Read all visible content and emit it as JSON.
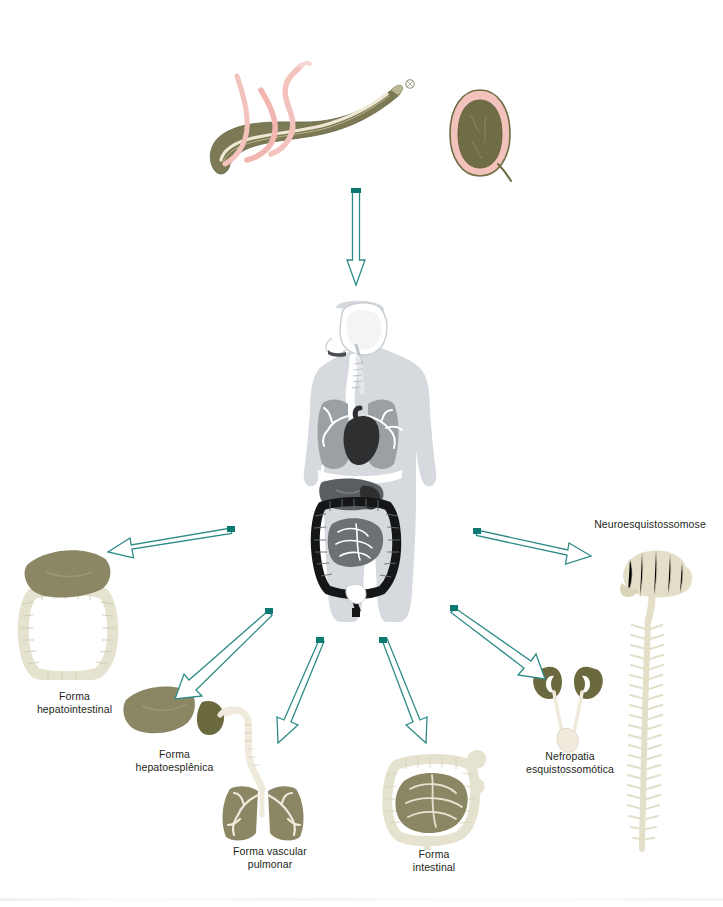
{
  "diagram": {
    "language": "pt-BR",
    "background_color": "#ffffff",
    "arrow_color": "#2e8b87",
    "arrow_cap_color": "#0c7a70",
    "arrow_fill": "#ffffff",
    "text_color": "#231f20"
  },
  "source": {
    "label": "Schistosoma mansoni",
    "worm": {
      "name": "adult-worm-pair",
      "body_color": "#7c7a54",
      "female_color": "#f4c2bd",
      "highlight_color": "#efe8d4"
    },
    "egg": {
      "name": "schistosome-egg",
      "shell_color": "#f4c2bd",
      "core_color": "#6f6d45"
    }
  },
  "host": {
    "name": "human-body-anatomy",
    "body_color": "#d6dade",
    "organ_dark": "#2e2f31",
    "organ_mid": "#7d8185",
    "organ_light": "#f2f4f5",
    "lung_color": "#9aa0a4",
    "liver_color": "#5b5e61"
  },
  "forms": [
    {
      "id": "hepatointestinal",
      "label": "Forma\nhepatointestinal",
      "organ": "liver-and-colon",
      "position": "left",
      "colors": {
        "liver": "#8b8663",
        "colon": "#e5e2cf"
      }
    },
    {
      "id": "hepatoesplenica",
      "label": "Forma\nhepatoesplênica",
      "organ": "liver-and-spleen",
      "position": "lower-left",
      "colors": {
        "liver": "#8b8663",
        "spleen": "#6b6a3f"
      }
    },
    {
      "id": "vascular-pulmonar",
      "label": "Forma vascular\npulmonar",
      "organ": "lungs-and-trachea",
      "position": "bottom-left",
      "colors": {
        "lung": "#8b8663",
        "airway": "#efeadc"
      }
    },
    {
      "id": "intestinal",
      "label": "Forma\nintestinal",
      "organ": "intestines",
      "position": "bottom-right",
      "colors": {
        "small_bowel": "#8b8663",
        "large_bowel": "#e5e2cf"
      }
    },
    {
      "id": "nefropatia",
      "label": "Nefropatia\nesquistossomótica",
      "organ": "kidneys-and-bladder",
      "position": "lower-right",
      "colors": {
        "kidney": "#6b6a3f",
        "ureter": "#efeadc"
      }
    },
    {
      "id": "neuroesquistossomose",
      "label": "Neuroesquistossomose",
      "organ": "brain-and-spinal-cord",
      "position": "right",
      "colors": {
        "nervous_tissue": "#e3dfc8"
      }
    }
  ],
  "arrows": [
    {
      "name": "arrow-source-to-host",
      "from": "worm-pair",
      "to": "human-body",
      "direction": "down"
    },
    {
      "name": "arrow-host-to-hepatointestinal",
      "from": "human-body",
      "to": "hepatointestinal",
      "direction": "left"
    },
    {
      "name": "arrow-host-to-hepatoesplenica",
      "from": "human-body",
      "to": "hepatoesplenica",
      "direction": "down-left"
    },
    {
      "name": "arrow-host-to-vascular-pulmonar",
      "from": "human-body",
      "to": "vascular-pulmonar",
      "direction": "down-left"
    },
    {
      "name": "arrow-host-to-intestinal",
      "from": "human-body",
      "to": "intestinal",
      "direction": "down-right"
    },
    {
      "name": "arrow-host-to-nefropatia",
      "from": "human-body",
      "to": "nefropatia",
      "direction": "down-right"
    },
    {
      "name": "arrow-host-to-neuroesquistossomose",
      "from": "human-body",
      "to": "neuroesquistossomose",
      "direction": "right"
    }
  ]
}
